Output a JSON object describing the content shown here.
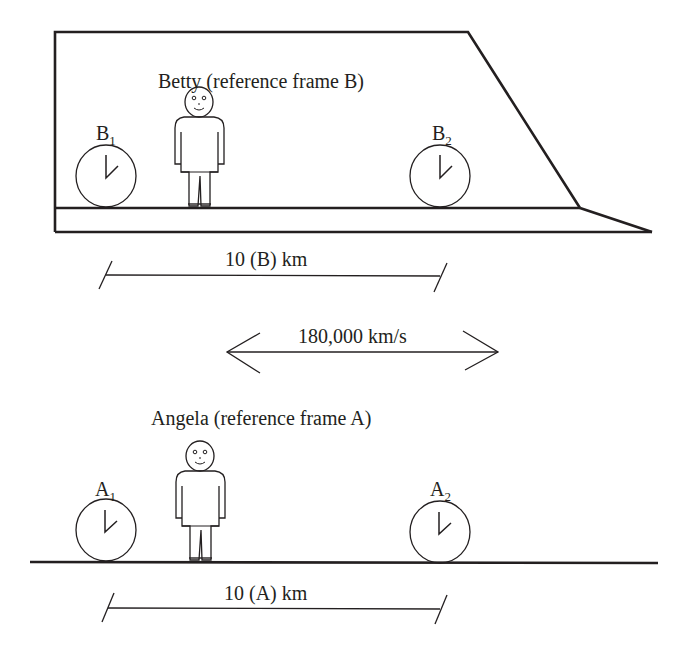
{
  "diagram": {
    "frame_b": {
      "title": "Betty (reference frame B)",
      "clock_1_label": "B",
      "clock_1_sub": "1",
      "clock_2_label": "B",
      "clock_2_sub": "2",
      "distance_label": "10 (B) km"
    },
    "velocity": {
      "label": "180,000 km/s",
      "direction": "bidirectional-arrow"
    },
    "frame_a": {
      "title": "Angela (reference frame A)",
      "clock_1_label": "A",
      "clock_1_sub": "1",
      "clock_2_label": "A",
      "clock_2_sub": "2",
      "distance_label": "10 (A) km"
    },
    "colors": {
      "ink": "#231f20",
      "background": "#ffffff"
    }
  }
}
